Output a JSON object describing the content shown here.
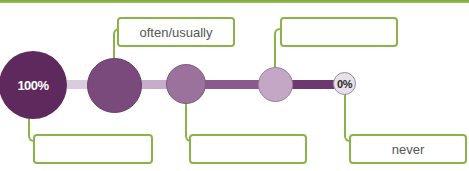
{
  "diagram": {
    "type": "frequency-scale",
    "colors": {
      "accent_green": "#8ab34a",
      "circle_1": "#5e2a5e",
      "circle_2": "#7b4a7d",
      "circle_3": "#9a729c",
      "circle_4": "#c3a7c5",
      "circle_5": "#e6e0e8",
      "bar_1": "#d9cddd",
      "bar_2": "#c7adcb",
      "bar_3": "#8a5a8e",
      "bar_4": "#6b3870"
    },
    "scale": {
      "start_label": "100%",
      "end_label": "0%"
    },
    "top_boxes": [
      {
        "label": "often/usually"
      },
      {
        "label": ""
      }
    ],
    "bottom_boxes": [
      {
        "label": ""
      },
      {
        "label": ""
      },
      {
        "label": "never"
      }
    ]
  }
}
